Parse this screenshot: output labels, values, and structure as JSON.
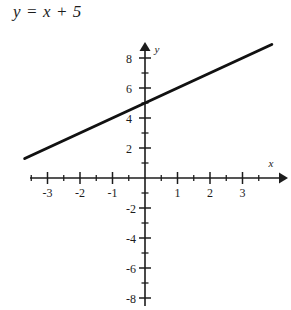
{
  "title": "y = x + 5",
  "colors": {
    "ink": "#1c1c1c",
    "line": "#111111",
    "background": "#ffffff"
  },
  "chart_data": {
    "type": "line",
    "title": "y = x + 5",
    "equation": "y = x + 5",
    "slope": 1,
    "intercept": 5,
    "xlabel": "x",
    "ylabel": "y",
    "xlim": [
      -3.6,
      4.2
    ],
    "ylim": [
      -8.6,
      9.0
    ],
    "grid": false,
    "legend": "none",
    "x_ticks_major": [
      -3,
      -2,
      -1,
      1,
      2,
      3
    ],
    "x_tick_labels": [
      "-3",
      "-2",
      "-1",
      "1",
      "2",
      "3"
    ],
    "x_ticks_minor": [
      -3.5,
      -2.5,
      -1.5,
      -0.5,
      0.5,
      1.5,
      2.5,
      3.5
    ],
    "y_ticks_major": [
      8,
      6,
      4,
      2,
      -2,
      -4,
      -6,
      -8
    ],
    "y_tick_labels": [
      "8",
      "6",
      "4",
      "2",
      "-2",
      "-4",
      "-6",
      "-8"
    ],
    "y_ticks_minor": [
      7,
      5,
      3,
      1,
      -1,
      -3,
      -5,
      -7
    ],
    "series": [
      {
        "name": "y = x + 5",
        "x": [
          -3.7,
          3.9
        ],
        "y": [
          1.3,
          8.9
        ],
        "points": [
          {
            "x": -3.7,
            "y": 1.3
          },
          {
            "x": -3.0,
            "y": 2.0
          },
          {
            "x": -1.0,
            "y": 4.0
          },
          {
            "x": 0.0,
            "y": 5.0
          },
          {
            "x": 1.0,
            "y": 6.0
          },
          {
            "x": 3.0,
            "y": 8.0
          },
          {
            "x": 3.9,
            "y": 8.9
          }
        ]
      }
    ],
    "axis_arrows": {
      "x": "right",
      "y": "up"
    }
  },
  "axes": {
    "x_name": "x",
    "y_name": "y"
  },
  "x_tick_labels": [
    {
      "value": -3,
      "text": "-3"
    },
    {
      "value": -2,
      "text": "-2"
    },
    {
      "value": -1,
      "text": "-1"
    },
    {
      "value": 1,
      "text": "1"
    },
    {
      "value": 2,
      "text": "2"
    },
    {
      "value": 3,
      "text": "3"
    }
  ],
  "y_tick_labels": [
    {
      "value": 8,
      "text": "8"
    },
    {
      "value": 6,
      "text": "6"
    },
    {
      "value": 4,
      "text": "4"
    },
    {
      "value": 2,
      "text": "2"
    },
    {
      "value": -2,
      "text": "-2"
    },
    {
      "value": -4,
      "text": "-4"
    },
    {
      "value": -6,
      "text": "-6"
    },
    {
      "value": -8,
      "text": "-8"
    }
  ]
}
